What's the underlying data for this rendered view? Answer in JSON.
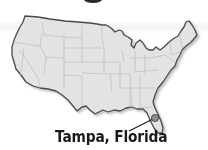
{
  "map": {
    "region": "Continental United States",
    "marker": {
      "label": "Tampa, Florida",
      "icon": "location-dot-icon"
    },
    "colors": {
      "land": "#e3e3e3",
      "state_borders": "#b5b5b5",
      "outline": "#4a4a4a",
      "marker": "#8c8c8c",
      "label": "#1a1a1a"
    }
  }
}
